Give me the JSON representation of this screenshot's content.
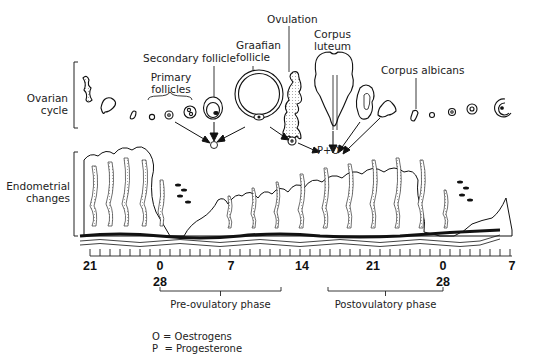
{
  "diagram": {
    "type": "menstrual-cycle-illustration",
    "row_labels": {
      "ovarian": "Ovarian\ncycle",
      "ovarian_line1": "Ovarian",
      "ovarian_line2": "cycle",
      "endometrial_line1": "Endometrial",
      "endometrial_line2": "changes"
    },
    "structure_labels": {
      "secondary_follicle": "Secondary follicle",
      "primary_follicles_line1": "Primary",
      "primary_follicles_line2": "follicles",
      "graafian_line1": "Graafian",
      "graafian_line2": "follicle",
      "ovulation": "Ovulation",
      "corpus_luteum_line1": "Corpus",
      "corpus_luteum_line2": "luteum",
      "corpus_albicans": "Corpus albicans"
    },
    "hormone_markers": {
      "follicular": "O",
      "luteal": "P+O"
    },
    "timeline": {
      "ticks": [
        {
          "label": "21",
          "x": 90
        },
        {
          "label": "0",
          "x": 160
        },
        {
          "label": "7",
          "x": 231
        },
        {
          "label": "14",
          "x": 302
        },
        {
          "label": "21",
          "x": 373
        },
        {
          "label": "0",
          "x": 443
        },
        {
          "label": "7",
          "x": 512
        }
      ],
      "sub_labels": [
        {
          "label": "28",
          "x": 160
        },
        {
          "label": "28",
          "x": 443
        }
      ],
      "minor_ticks_per_day": 1,
      "start_x": 90,
      "end_x": 512
    },
    "phases": [
      {
        "label": "Pre-ovulatory phase",
        "x_start": 160,
        "x_end": 281
      },
      {
        "label": "Postovulatory phase",
        "x_start": 328,
        "x_end": 443
      }
    ],
    "legend": [
      {
        "symbol": "O",
        "text": "= Oestrogens"
      },
      {
        "symbol": "P",
        "text": " = Progesterone"
      }
    ],
    "colors": {
      "line": "#111111",
      "stipple": "#c8c8c8",
      "background": "#ffffff"
    }
  }
}
